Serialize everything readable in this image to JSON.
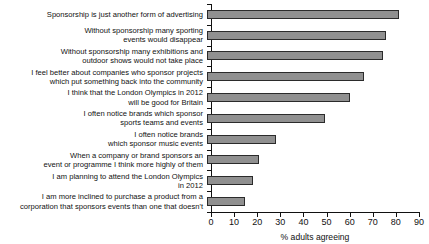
{
  "chart_data": {
    "type": "bar",
    "orientation": "horizontal",
    "title": "",
    "subtitle": "",
    "xlabel": "% adults agreeing",
    "ylabel": "",
    "xlim": [
      0,
      90
    ],
    "xticks": [
      0,
      10,
      20,
      30,
      40,
      50,
      60,
      70,
      80,
      90
    ],
    "xtick_labels": [
      "0",
      "10",
      "20",
      "30",
      "40",
      "50",
      "60",
      "70",
      "80",
      "90"
    ],
    "grid": false,
    "legend": false,
    "bar_color": "#909090",
    "bar_edge_color": "#2b2b2b",
    "axis_color": "#111111",
    "categories": [
      "Sponsorship is just another form of advertising",
      "Without sponsorship many sporting\nevents would disappear",
      "Without sponsorship many exhibitions and\noutdoor shows would not take place",
      "I feel better about companies who sponsor projects\nwhich put something back into the community",
      "I think that the London Olympics in 2012\nwill be good for Britain",
      "I often notice brands which sponsor\nsports teams and events",
      "I often notice brands\nwhich sponsor music events",
      "When a company or brand sponsors an\nevent or programme I think more highly of them",
      "I am planning to attend the London Olympics\nin 2012",
      "I am more inclined to purchase a product from a\ncorporation that sponsors events than one that doesn't"
    ],
    "values": [
      83,
      77.5,
      76,
      68,
      62,
      51,
      30,
      22.5,
      20,
      16.5
    ]
  }
}
